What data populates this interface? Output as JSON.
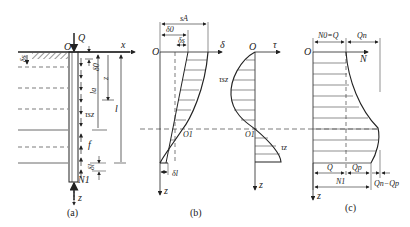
{
  "figure": {
    "panels": [
      {
        "id": "a",
        "caption": "(a)"
      },
      {
        "id": "b",
        "caption": "(b)"
      },
      {
        "id": "c",
        "caption": "(c)"
      }
    ]
  },
  "panel_a": {
    "origin": "O",
    "load": "Q",
    "x_axis": "x",
    "z_axis": "z",
    "labels": {
      "ds": "δs",
      "d0_top": "δ0",
      "la": "la",
      "z": "z",
      "l": "l",
      "tau": "τsz",
      "f": "f",
      "dl": "δl",
      "N1": "N1"
    }
  },
  "panel_b": {
    "origin": "O",
    "axis_delta": "δ",
    "axis_tau": "τ",
    "z_axis": "z",
    "labels": {
      "sa": "sA",
      "d0": "δ0",
      "ds": "δs",
      "dl": "δl",
      "O1": "O1",
      "O1b": "O1",
      "tau_sz": "τsz",
      "tau_z": "τz"
    }
  },
  "panel_c": {
    "origin": "O",
    "axis_N": "N",
    "z_axis": "z",
    "labels": {
      "N0Q": "N0=Q",
      "Qn": "Qn",
      "Q": "Q",
      "Qp": "Qp",
      "N1": "N1",
      "QnQp": "Qn−Qp"
    }
  },
  "colors": {
    "ink": "#222222",
    "background": "#ffffff"
  }
}
